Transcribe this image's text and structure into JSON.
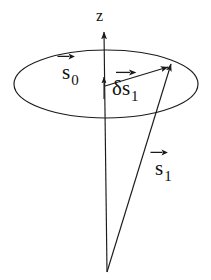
{
  "figure": {
    "background_color": "#ffffff",
    "stroke_color": "#1a1a1a",
    "axis": {
      "name": "z-axis",
      "label": "z",
      "label_position": {
        "x": 96,
        "y": 8
      },
      "line": {
        "x1": 107,
        "y1": 272,
        "x2": 104,
        "y2": 30
      },
      "arrowhead_at": "top"
    },
    "ellipse": {
      "name": "precession-circle",
      "cx": 106,
      "cy": 84,
      "rx": 92,
      "ry": 34
    },
    "vectors": [
      {
        "id": "s0",
        "label_base": "s",
        "label_subscript": "0",
        "label_prefix": "",
        "description": "short vector along the z axis from cone apex region",
        "from": {
          "x": 104,
          "y": 98
        },
        "to": {
          "x": 104,
          "y": 74
        },
        "label_position": {
          "x": 62,
          "y": 62
        }
      },
      {
        "id": "ds1",
        "label_base": "s",
        "label_subscript": "1",
        "label_prefix": "δ",
        "description": "vector from the z axis to a point on the precession circle",
        "from": {
          "x": 106,
          "y": 86
        },
        "to": {
          "x": 170,
          "y": 66
        },
        "label_position": {
          "x": 112,
          "y": 78
        }
      },
      {
        "id": "s1",
        "label_base": "s",
        "label_subscript": "1",
        "label_prefix": "",
        "description": "long vector from the cone apex to the same point on the precession circle",
        "from": {
          "x": 107,
          "y": 272
        },
        "to": {
          "x": 172,
          "y": 62
        },
        "label_position": {
          "x": 155,
          "y": 158
        }
      }
    ]
  }
}
